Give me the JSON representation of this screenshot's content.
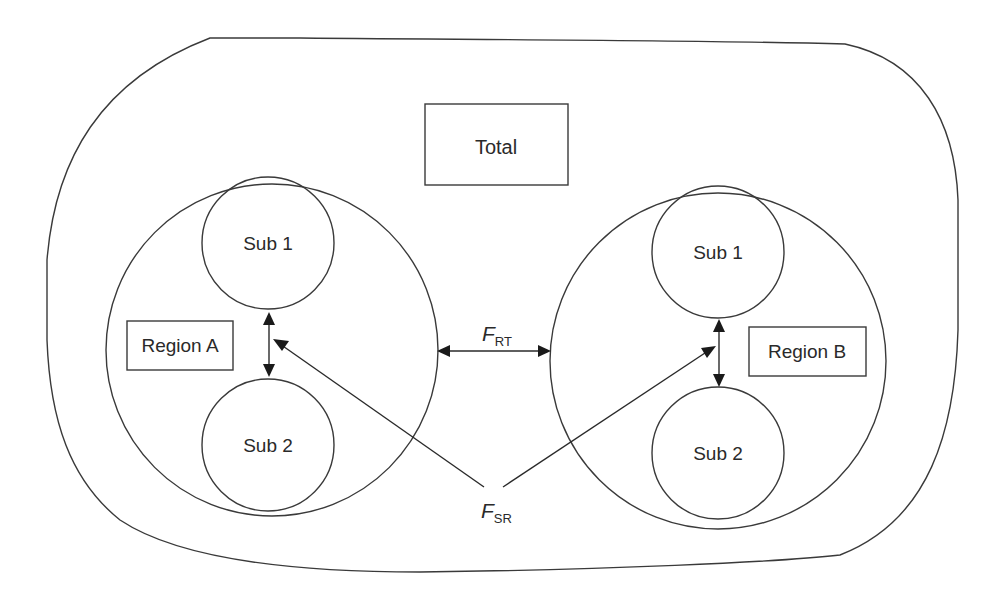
{
  "diagram": {
    "total": {
      "label": "Total"
    },
    "region_a": {
      "label": "Region A",
      "sub1": "Sub 1",
      "sub2": "Sub 2"
    },
    "region_b": {
      "label": "Region B",
      "sub1": "Sub 1",
      "sub2": "Sub 2"
    },
    "flows": {
      "rt": {
        "symbol": "F",
        "subscript": "RT"
      },
      "sr": {
        "symbol": "F",
        "subscript": "SR"
      }
    },
    "colors": {
      "stroke": "#3a3a3a",
      "text": "#2a2a2a",
      "background": "#ffffff"
    }
  }
}
